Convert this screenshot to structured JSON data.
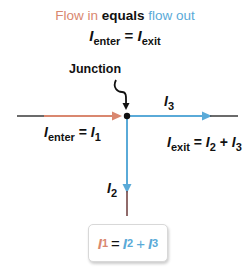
{
  "title": {
    "flow_in": "Flow in",
    "equals": "equals",
    "flow_out": "flow out"
  },
  "equation_top": {
    "lhs_var": "I",
    "lhs_sub": "enter",
    "op": "=",
    "rhs_var": "I",
    "rhs_sub": "exit"
  },
  "junction_label": "Junction",
  "labels": {
    "i3": {
      "var": "I",
      "sub": "3"
    },
    "i2": {
      "var": "I",
      "sub": "2"
    },
    "enter": {
      "var": "I",
      "sub": "enter",
      "op": "=",
      "rhs_var": "I",
      "rhs_sub": "1"
    },
    "exit": {
      "var": "I",
      "sub": "exit",
      "op": "=",
      "t1_var": "I",
      "t1_sub": "2",
      "plus": "+",
      "t2_var": "I",
      "t2_sub": "3"
    }
  },
  "box_equation": {
    "lhs_var": "I",
    "lhs_sub": "1",
    "op": "=",
    "t1_var": "I",
    "t1_sub": "2",
    "plus": "+",
    "t2_var": "I",
    "t2_sub": "3"
  },
  "colors": {
    "inflow": "#d9876f",
    "outflow": "#5aaad8",
    "wire": "#3a3a3a",
    "junction_dot": "#111111"
  }
}
